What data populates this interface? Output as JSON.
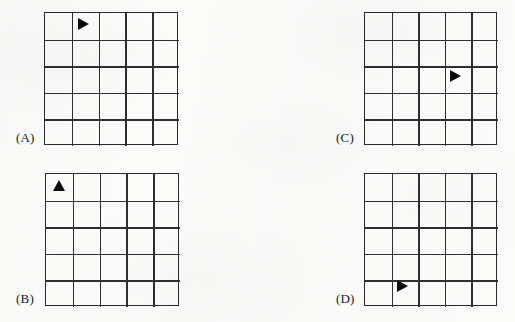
{
  "figure": {
    "background_color": "#fbfbfa",
    "line_color": "#2a2a2a",
    "marker_color": "#0b0b0b",
    "grid_rows": 5,
    "grid_cols": 5
  },
  "panels": [
    {
      "id": "A",
      "label": "(A)",
      "label_x": 16,
      "label_y": 130,
      "box_x": 44,
      "box_y": 12,
      "box_w": 134,
      "box_h": 133,
      "marker": {
        "icon": "triangle-right-marker",
        "direction": "right",
        "row": 1,
        "col": 2,
        "x": 78,
        "y": 18
      }
    },
    {
      "id": "B",
      "label": "(B)",
      "label_x": 16,
      "label_y": 291,
      "box_x": 45,
      "box_y": 173,
      "box_w": 134,
      "box_h": 133,
      "marker": {
        "icon": "triangle-up-marker",
        "direction": "up",
        "row": 1,
        "col": 1,
        "x": 53,
        "y": 180
      }
    },
    {
      "id": "C",
      "label": "(C)",
      "label_x": 336,
      "label_y": 130,
      "box_x": 364,
      "box_y": 12,
      "box_w": 133,
      "box_h": 133,
      "marker": {
        "icon": "triangle-right-marker",
        "direction": "right",
        "row": 3,
        "col": 4,
        "x": 450,
        "y": 70
      }
    },
    {
      "id": "D",
      "label": "(D)",
      "label_x": 336,
      "label_y": 291,
      "box_x": 364,
      "box_y": 173,
      "box_w": 133,
      "box_h": 133,
      "marker": {
        "icon": "triangle-right-marker",
        "direction": "right",
        "row": 5,
        "col": 2,
        "x": 397,
        "y": 280
      }
    }
  ]
}
